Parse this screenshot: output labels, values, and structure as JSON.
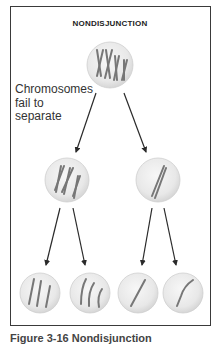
{
  "title": "NONDISJUNCTION",
  "annotation": {
    "line1": "Chromosomes",
    "line2": "fail to",
    "line3": "separate"
  },
  "caption": "Figure 3-16 Nondisjunction",
  "colors": {
    "cell_fill": "#e9e9e9",
    "cell_edge": "#c8c8c8",
    "chromosome": "#7a7a7a",
    "arrow": "#2a2a2a",
    "frame": "#3a3a3a"
  },
  "cells": {
    "parent": {
      "chromosome_count": 4,
      "chromosome_type": "replicated"
    },
    "daughters": [
      {
        "chromosome_count": 3,
        "chromosome_type": "replicated"
      },
      {
        "chromosome_count": 1,
        "chromosome_type": "replicated"
      }
    ],
    "gametes": [
      {
        "chromosome_count": 3,
        "chromosome_type": "single"
      },
      {
        "chromosome_count": 3,
        "chromosome_type": "single"
      },
      {
        "chromosome_count": 1,
        "chromosome_type": "single"
      },
      {
        "chromosome_count": 1,
        "chromosome_type": "single"
      }
    ]
  }
}
